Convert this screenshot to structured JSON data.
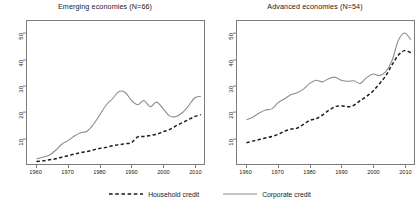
{
  "figure": {
    "background": "#ffffff",
    "frame_color": "#7d7d7d"
  },
  "legend": {
    "items": [
      {
        "label": "Household credit",
        "style": "dashed",
        "color": "#1a1a1a"
      },
      {
        "label": "Corporate credit",
        "style": "solid",
        "color": "#8c8c8c"
      }
    ]
  },
  "chart_data": [
    {
      "type": "line",
      "panel": "left",
      "title": "Emerging economies (N=66)",
      "xlabel": "",
      "ylabel": "",
      "xlim": [
        1957,
        2013
      ],
      "ylim": [
        0,
        55
      ],
      "xticks": [
        1960,
        1970,
        1980,
        1990,
        2000,
        2010
      ],
      "yticks": [
        10,
        20,
        30,
        40,
        50
      ],
      "grid": false,
      "legend_position": "bottom-center-shared",
      "x": [
        1960,
        1962,
        1964,
        1966,
        1968,
        1970,
        1972,
        1974,
        1976,
        1978,
        1980,
        1982,
        1984,
        1986,
        1988,
        1990,
        1992,
        1994,
        1996,
        1998,
        2000,
        2002,
        2004,
        2006,
        2008,
        2010,
        2012
      ],
      "series": [
        {
          "name": "Corporate credit",
          "style": "solid",
          "color": "#8c8c8c",
          "values": [
            2.0,
            2.6,
            3.4,
            5.2,
            7.6,
            9.0,
            10.8,
            12.0,
            12.6,
            15.2,
            18.8,
            22.6,
            25.0,
            27.8,
            27.6,
            24.6,
            22.8,
            24.4,
            22.0,
            23.8,
            21.4,
            18.6,
            18.2,
            19.6,
            22.2,
            25.4,
            26.0
          ]
        },
        {
          "name": "Household credit",
          "style": "dashed",
          "color": "#1a1a1a",
          "values": [
            1.0,
            1.2,
            1.6,
            2.0,
            2.6,
            3.2,
            3.8,
            4.4,
            4.8,
            5.4,
            6.0,
            6.4,
            7.0,
            7.4,
            7.8,
            8.2,
            10.4,
            10.6,
            11.0,
            11.4,
            12.4,
            13.2,
            14.6,
            15.8,
            17.0,
            18.2,
            19.0
          ]
        }
      ]
    },
    {
      "type": "line",
      "panel": "right",
      "title": "Advanced economies (N=54)",
      "xlabel": "",
      "ylabel": "",
      "xlim": [
        1957,
        2013
      ],
      "ylim": [
        0,
        55
      ],
      "xticks": [
        1960,
        1970,
        1980,
        1990,
        2000,
        2010
      ],
      "yticks": [
        10,
        20,
        30,
        40,
        50
      ],
      "grid": false,
      "legend_position": "bottom-center-shared",
      "x": [
        1960,
        1962,
        1964,
        1966,
        1968,
        1970,
        1972,
        1974,
        1976,
        1978,
        1980,
        1982,
        1984,
        1986,
        1988,
        1990,
        1992,
        1994,
        1996,
        1998,
        2000,
        2002,
        2004,
        2006,
        2008,
        2010,
        2012
      ],
      "series": [
        {
          "name": "Corporate credit",
          "style": "solid",
          "color": "#8c8c8c",
          "values": [
            17.0,
            18.0,
            19.6,
            20.8,
            21.2,
            23.6,
            25.0,
            26.6,
            27.4,
            28.8,
            31.0,
            32.2,
            31.6,
            32.8,
            33.4,
            32.2,
            31.8,
            32.0,
            31.0,
            33.2,
            34.6,
            34.0,
            35.4,
            39.6,
            47.4,
            50.4,
            47.8
          ]
        },
        {
          "name": "Household credit",
          "style": "dashed",
          "color": "#1a1a1a",
          "values": [
            8.2,
            8.8,
            9.4,
            10.0,
            10.6,
            11.4,
            12.6,
            13.4,
            13.8,
            15.2,
            16.8,
            17.4,
            18.8,
            20.6,
            22.0,
            22.4,
            22.0,
            22.6,
            24.4,
            26.0,
            28.0,
            30.8,
            33.8,
            38.0,
            41.8,
            43.6,
            42.8
          ]
        }
      ]
    }
  ]
}
